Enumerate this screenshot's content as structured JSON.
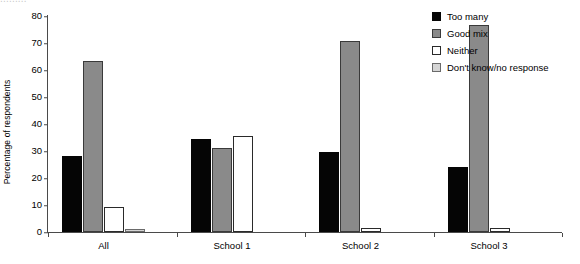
{
  "chart_data": {
    "type": "bar",
    "title": "",
    "xlabel": "",
    "ylabel": "Percentage of respondents",
    "categories": [
      "All",
      "School 1",
      "School 2",
      "School 3"
    ],
    "ylim": [
      0,
      80
    ],
    "yticks": [
      0,
      10,
      20,
      30,
      40,
      50,
      60,
      70,
      80
    ],
    "grid": false,
    "legend_position": "top-right",
    "series": [
      {
        "name": "Too many",
        "color": "#050505",
        "values": [
          28.3,
          34.5,
          29.6,
          24.0
        ]
      },
      {
        "name": "Good mix",
        "color": "#8a8a8a",
        "values": [
          63.2,
          31.2,
          70.8,
          76.8
        ]
      },
      {
        "name": "Neither",
        "color": "#ffffff",
        "values": [
          9.4,
          35.5,
          1.5,
          1.6
        ]
      },
      {
        "name": "Don't know/no response",
        "color": "#d5d5d5",
        "values": [
          1.0,
          0.0,
          0.0,
          0.0
        ]
      }
    ]
  },
  "axis": {
    "y_title": "Percentage of respondents",
    "tick_labels": [
      "0",
      "10",
      "20",
      "30",
      "40",
      "50",
      "60",
      "70",
      "80"
    ],
    "category_labels": [
      "All",
      "School 1",
      "School 2",
      "School 3"
    ]
  },
  "legend": {
    "items": [
      {
        "label": "Too many",
        "swatch": "black-square-swatch"
      },
      {
        "label": "Good mix",
        "swatch": "dark-gray-square-swatch"
      },
      {
        "label": "Neither",
        "swatch": "white-square-swatch"
      },
      {
        "label": "Don't know/no response",
        "swatch": "light-gray-square-swatch"
      }
    ]
  },
  "artifacts": {
    "cropped_title_remnant": "........."
  }
}
